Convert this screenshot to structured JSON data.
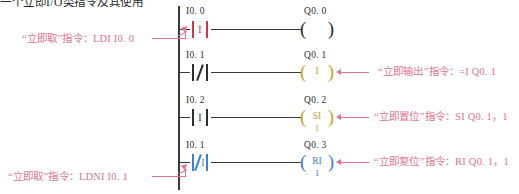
{
  "document": {
    "header_cut_text": "一个立即I/O类指令及其使用",
    "title": "PLC 梯形图 — 立即指令",
    "background_color": "#ffffff"
  },
  "colors": {
    "annotation_pink": "#e0738f",
    "immediate_red": "#d1344a",
    "immediate_blue": "#3b7fd4",
    "coil_gold": "#c9a227",
    "line_black": "#3a3a3a"
  },
  "ladder": {
    "rungs": [
      {
        "index": 1,
        "contact": {
          "operand": "I0. 0",
          "type": "normally-open-immediate",
          "inner_letter": "I",
          "color": "#d1344a"
        },
        "coil": {
          "operand": "Q0. 0",
          "type": "output-coil",
          "inner_letter": "",
          "below_value": "",
          "color": "#2d2d2d"
        }
      },
      {
        "index": 2,
        "contact": {
          "operand": "I0. 1",
          "type": "normally-closed",
          "inner_letter": "",
          "color": "#2d2d2d"
        },
        "coil": {
          "operand": "Q0. 1",
          "type": "immediate-output-coil",
          "inner_letter": "I",
          "below_value": "",
          "color": "#c9a227"
        }
      },
      {
        "index": 3,
        "contact": {
          "operand": "I0. 2",
          "type": "normally-open-immediate",
          "inner_letter": "I",
          "color": "#2d2d2d"
        },
        "coil": {
          "operand": "Q0. 2",
          "type": "immediate-set-coil",
          "inner_letter": "SI",
          "below_value": "1",
          "color": "#c9a227"
        }
      },
      {
        "index": 4,
        "contact": {
          "operand": "I0. 1",
          "type": "normally-closed-immediate",
          "inner_letter": "I",
          "color": "#3b7fd4"
        },
        "coil": {
          "operand": "Q0. 3",
          "type": "immediate-reset-coil",
          "inner_letter": "RI",
          "below_value": "1",
          "color": "#3b7fd4"
        }
      }
    ]
  },
  "annotations": [
    {
      "id": "ldi",
      "side": "left",
      "quoted": "“立即取”",
      "label": "指令：",
      "instruction": "LDI  I0. 0",
      "full_text": "“立即取”指令：LDI  I0. 0",
      "target": "rung-1-contact"
    },
    {
      "id": "ldni",
      "side": "left",
      "quoted": "“立即取”",
      "label": "指令：",
      "instruction": "LDNI  I0. 1",
      "full_text": "“立即取”指令：LDNI  I0. 1",
      "target": "rung-4-contact"
    },
    {
      "id": "imm-out",
      "side": "right",
      "quoted": "“立即输出”",
      "label": "指令：",
      "instruction": "=I  Q0. 1",
      "full_text": "“立即输出”指令：=I  Q0. 1",
      "target": "rung-2-coil"
    },
    {
      "id": "imm-set",
      "side": "right",
      "quoted": "“立即置位”",
      "label": "指令：",
      "instruction": "SI  Q0. 1，1",
      "full_text": "“立即置位”指令：SI  Q0. 1，1",
      "target": "rung-3-coil"
    },
    {
      "id": "imm-reset",
      "side": "right",
      "quoted": "“立即复位”",
      "label": "指令：",
      "instruction": "RI  Q0. 1，1",
      "full_text": "“立即复位”指令：RI  Q0. 1，1",
      "target": "rung-4-coil"
    }
  ]
}
